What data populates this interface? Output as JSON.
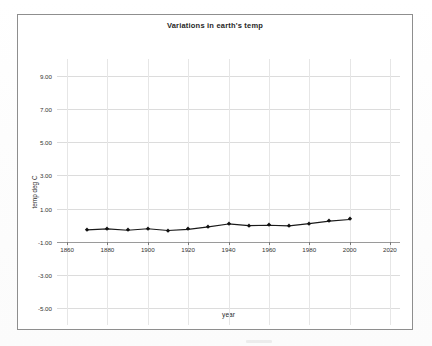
{
  "document": {
    "background_color": "#ffffff",
    "frame_border_color": "#8e8e8e"
  },
  "chart_data": {
    "type": "line",
    "title": "Variations in earth's temp",
    "xlabel": "year",
    "ylabel": "temp deg C",
    "xlim": [
      1855,
      2025
    ],
    "ylim": [
      -6.0,
      10.0
    ],
    "grid": true,
    "legend": "none",
    "marker": "diamond",
    "line_color": "#1a1a1a",
    "marker_color": "#111111",
    "x_ticks": [
      1860,
      1880,
      1900,
      1920,
      1940,
      1960,
      1980,
      2000,
      2020
    ],
    "x_tick_labels": [
      "1860",
      "1880",
      "1900",
      "1920",
      "1940",
      "1960",
      "1980",
      "2000",
      "2020"
    ],
    "y_ticks": [
      9.0,
      7.0,
      5.0,
      3.0,
      1.0,
      -1.0,
      -3.0,
      -5.0
    ],
    "y_tick_labels": [
      "9.00",
      "7.00",
      "5.00",
      "3.00",
      "1.00",
      "-1.00",
      "-3.00",
      "-5.00"
    ],
    "x": [
      1870,
      1880,
      1890,
      1900,
      1910,
      1920,
      1930,
      1940,
      1950,
      1960,
      1970,
      1980,
      1990,
      2000
    ],
    "values": [
      -0.28,
      -0.22,
      -0.3,
      -0.21,
      -0.32,
      -0.25,
      -0.1,
      0.08,
      -0.02,
      0.0,
      -0.04,
      0.1,
      0.25,
      0.35
    ],
    "series": [
      {
        "name": "temp deg C",
        "values": [
          -0.28,
          -0.22,
          -0.3,
          -0.21,
          -0.32,
          -0.25,
          -0.1,
          0.08,
          -0.02,
          0.0,
          -0.04,
          0.1,
          0.25,
          0.35
        ]
      }
    ]
  }
}
